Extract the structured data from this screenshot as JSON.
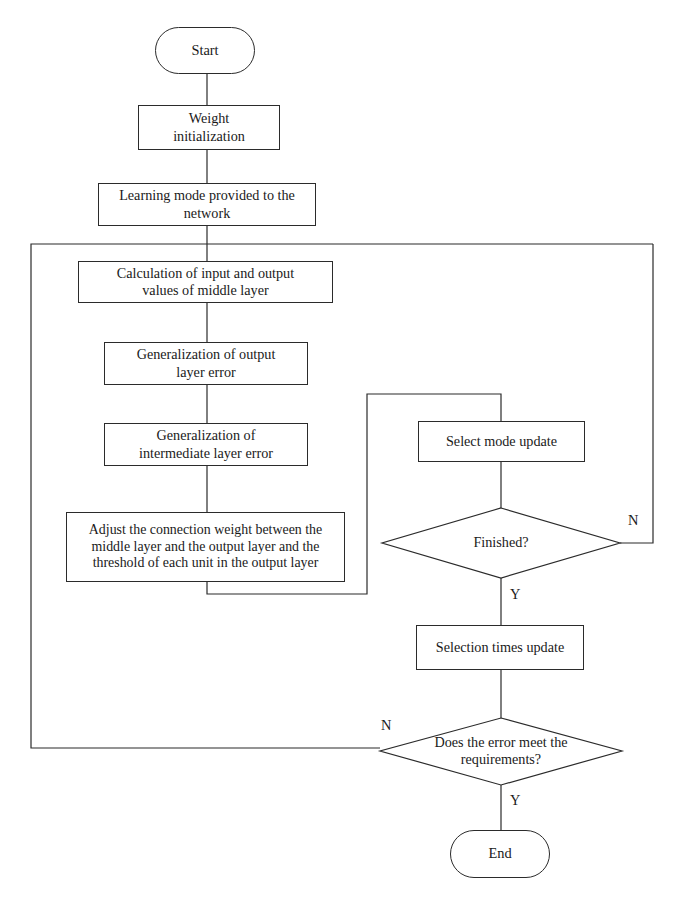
{
  "diagram": {
    "stroke_color": "#2b2b2b",
    "background_color": "#ffffff",
    "text_color": "#1a1a1a"
  },
  "nodes": {
    "start": {
      "label": "Start",
      "shape": "terminator"
    },
    "weight_init": {
      "label": "Weight initialization",
      "line1": "Weight",
      "line2": "initialization",
      "shape": "process"
    },
    "learning_mode": {
      "label": "Learning mode provided to the network",
      "line1": "Learning mode provided to the",
      "line2": "network",
      "shape": "process"
    },
    "calculation": {
      "label": "Calculation of input and output values of middle layer",
      "line1": "Calculation of input and output",
      "line2": "values of middle layer",
      "shape": "process"
    },
    "gen_output": {
      "label": "Generalization of output layer error",
      "line1": "Generalization of output",
      "line2": "layer error",
      "shape": "process"
    },
    "gen_intermediate": {
      "label": "Generalization of intermediate layer error",
      "line1": "Generalization of",
      "line2": "intermediate layer error",
      "shape": "process"
    },
    "adjust": {
      "label": "Adjust the connection weight between the middle layer and the output layer and the threshold of each unit in the output layer",
      "line1": "Adjust the connection weight between the",
      "line2": "middle layer and the output layer and the",
      "line3": "threshold of each unit in the output layer",
      "shape": "process"
    },
    "select_mode_update": {
      "label": "Select mode update",
      "shape": "process"
    },
    "finished": {
      "label": "Finished?",
      "shape": "decision"
    },
    "selection_times_update": {
      "label": "Selection times update",
      "shape": "process"
    },
    "error_check": {
      "label": "Does the error meet the requirements?",
      "line1": "Does the error meet the",
      "line2": "requirements?",
      "shape": "decision"
    },
    "end": {
      "label": "End",
      "shape": "terminator"
    }
  },
  "edge_labels": {
    "finished_no": "N",
    "finished_yes": "Y",
    "error_no": "N",
    "error_yes": "Y"
  }
}
